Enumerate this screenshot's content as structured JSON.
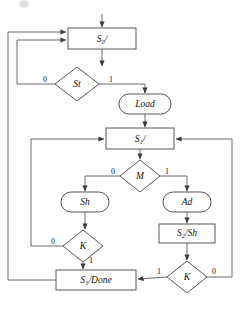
{
  "diagram": {
    "type": "asm-chart",
    "colors": {
      "stroke": "#58585a",
      "line": "#6a6a6c",
      "text": "#111111",
      "background": "#ffffff"
    },
    "states": [
      {
        "id": "s0",
        "label": "S₀/",
        "shape": "rectangle",
        "x": 68,
        "y": 28,
        "w": 68,
        "h": 21
      },
      {
        "id": "s1",
        "label": "S₁/",
        "shape": "rectangle",
        "x": 106,
        "y": 128,
        "w": 68,
        "h": 21
      },
      {
        "id": "s2",
        "label": "S₂/Sh",
        "shape": "rectangle",
        "x": 159,
        "y": 224,
        "w": 56,
        "h": 19
      },
      {
        "id": "s3",
        "label": "S₃/Done",
        "shape": "rectangle",
        "x": 56,
        "y": 270,
        "w": 80,
        "h": 20
      }
    ],
    "decisions": [
      {
        "id": "st",
        "label": "St",
        "shape": "diamond",
        "cx": 77,
        "cy": 84,
        "rx": 22,
        "ry": 17,
        "branches": [
          {
            "value": "0",
            "side": "left"
          },
          {
            "value": "1",
            "side": "right"
          }
        ]
      },
      {
        "id": "m",
        "label": "M",
        "shape": "diamond",
        "cx": 140,
        "cy": 176,
        "rx": 20,
        "ry": 16,
        "branches": [
          {
            "value": "0",
            "side": "left"
          },
          {
            "value": "1",
            "side": "right"
          }
        ]
      },
      {
        "id": "k-left",
        "label": "K",
        "shape": "diamond",
        "cx": 83,
        "cy": 246,
        "rx": 20,
        "ry": 16,
        "branches": [
          {
            "value": "0",
            "side": "left"
          },
          {
            "value": "1",
            "side": "bottom"
          }
        ]
      },
      {
        "id": "k-right",
        "label": "K",
        "shape": "diamond",
        "cx": 187,
        "cy": 277,
        "rx": 20,
        "ry": 16,
        "branches": [
          {
            "value": "1",
            "side": "left"
          },
          {
            "value": "0",
            "side": "right"
          }
        ]
      }
    ],
    "outputs": [
      {
        "id": "load",
        "label": "Load",
        "shape": "oval",
        "cx": 145,
        "cy": 104,
        "rx": 26,
        "ry": 10
      },
      {
        "id": "sh",
        "label": "Sh",
        "shape": "oval",
        "cx": 85,
        "cy": 202,
        "rx": 24,
        "ry": 10
      },
      {
        "id": "ad",
        "label": "Ad",
        "shape": "oval",
        "cx": 187,
        "cy": 202,
        "rx": 24,
        "ry": 10
      }
    ],
    "edge_labels": [
      {
        "id": "st-0",
        "text": "0",
        "x": 45,
        "y": 80
      },
      {
        "id": "st-1",
        "text": "1",
        "x": 111,
        "y": 80
      },
      {
        "id": "m-0",
        "text": "0",
        "x": 113,
        "y": 172
      },
      {
        "id": "m-1",
        "text": "1",
        "x": 167,
        "y": 172
      },
      {
        "id": "kleft-0",
        "text": "0",
        "x": 53,
        "y": 242
      },
      {
        "id": "kleft-1",
        "text": "1",
        "x": 91,
        "y": 261
      },
      {
        "id": "kright-1",
        "text": "1",
        "x": 159,
        "y": 272
      },
      {
        "id": "kright-0",
        "text": "0",
        "x": 214,
        "y": 272
      }
    ],
    "entry": {
      "id": "entry-arrow",
      "label": "start"
    }
  }
}
